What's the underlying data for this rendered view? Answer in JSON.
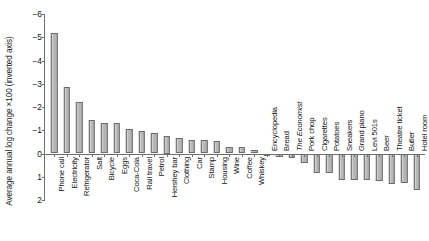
{
  "chart_data": {
    "type": "bar",
    "title": "",
    "xlabel": "",
    "ylabel": "Average annual log change ×100 (inverted axis)",
    "ylim": [
      2,
      -6
    ],
    "inverted_yaxis": true,
    "grid": false,
    "legend": null,
    "ytick_labels": [
      "−6",
      "−5",
      "−4",
      "−3",
      "−2",
      "−1",
      "0",
      "1",
      "2"
    ],
    "ytick_values": [
      -6,
      -5,
      -4,
      -3,
      -2,
      -1,
      0,
      1,
      2
    ],
    "bar_color": "#b4b4b4",
    "bar_edge_color": "#6b6b6b",
    "axis_color": "#6e6e6e",
    "categories": [
      "Phone call",
      "Electricity",
      "Refrigerator",
      "Salt",
      "Bicycle",
      "Eggs",
      "Coca-Cola",
      "Rail travel",
      "Petrol",
      "Hershey bar",
      "Clothing",
      "Car",
      "Stamp",
      "Housing",
      "Wine",
      "Coffee",
      "Whiskey",
      "Encyclopedia",
      "Bread",
      "The Economist",
      "Pork chop",
      "Cigarettes",
      "Potatoes",
      "Sneakers",
      "Grand piano",
      "Levi 501s",
      "Beer",
      "Theatre ticket",
      "Butler",
      "Hotel room"
    ],
    "values": [
      -5.2,
      -2.85,
      -2.2,
      -1.45,
      -1.3,
      -1.3,
      -1.05,
      -0.95,
      -0.9,
      -0.75,
      -0.65,
      -0.6,
      -0.6,
      -0.55,
      -0.3,
      -0.3,
      -0.15,
      0.12,
      0.15,
      0.2,
      0.42,
      0.82,
      0.85,
      1.12,
      1.12,
      1.15,
      1.2,
      1.3,
      1.25,
      1.55
    ],
    "italic_categories": [
      "The Economist"
    ]
  }
}
